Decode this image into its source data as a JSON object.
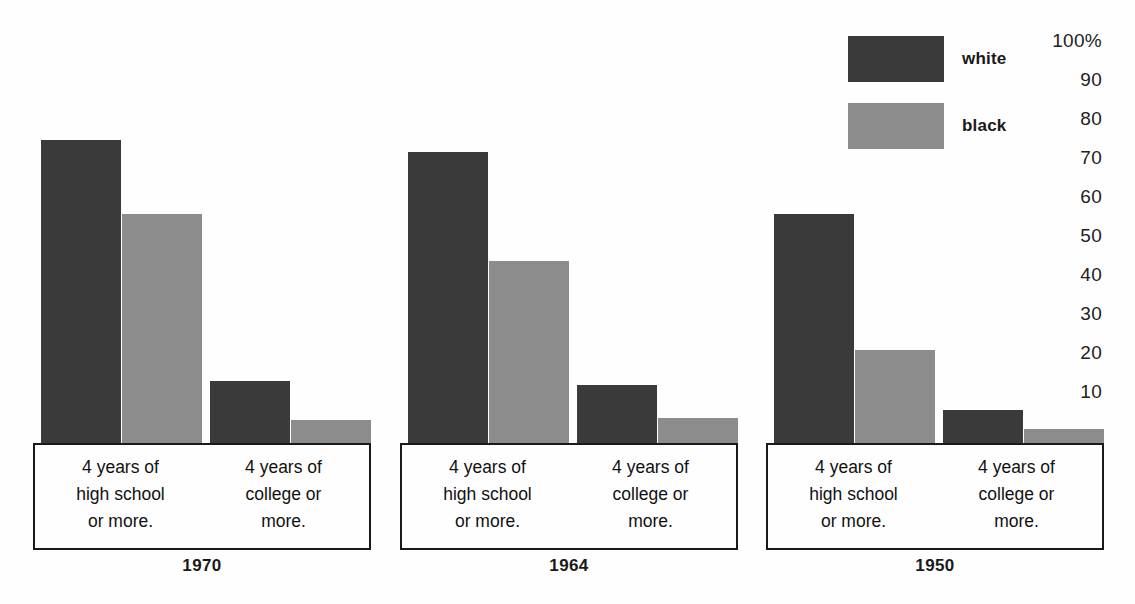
{
  "legend": {
    "items": [
      {
        "label": "white",
        "color": "#3a3a3a",
        "swatch_name": "legend-swatch-white"
      },
      {
        "label": "black",
        "color": "#8c8c8c",
        "swatch_name": "legend-swatch-black"
      }
    ]
  },
  "yaxis": {
    "ticks": [
      {
        "label": "100%",
        "value": 100
      },
      {
        "label": "90",
        "value": 90
      },
      {
        "label": "80",
        "value": 80
      },
      {
        "label": "70",
        "value": 70
      },
      {
        "label": "60",
        "value": 60
      },
      {
        "label": "50",
        "value": 50
      },
      {
        "label": "40",
        "value": 40
      },
      {
        "label": "30",
        "value": 30
      },
      {
        "label": "20",
        "value": 20
      },
      {
        "label": "10",
        "value": 10
      }
    ]
  },
  "categories": [
    {
      "id": "hs",
      "caption": "4 years of\nhigh school\nor more."
    },
    {
      "id": "col",
      "caption": "4 years of\ncollege or\nmore."
    }
  ],
  "groups": [
    {
      "year": "1970",
      "box_left": 33,
      "box_width": 338,
      "cells": [
        {
          "caption": "4 years of\nhigh school\nor more.",
          "bars": [
            {
              "series": "white",
              "value": 78
            },
            {
              "series": "black",
              "value": 59
            }
          ]
        },
        {
          "caption": "4 years of\ncollege or\nmore.",
          "bars": [
            {
              "series": "white",
              "value": 16
            },
            {
              "series": "black",
              "value": 6
            }
          ]
        }
      ]
    },
    {
      "year": "1964",
      "box_left": 400,
      "box_width": 338,
      "cells": [
        {
          "caption": "4 years of\nhigh school\nor more.",
          "bars": [
            {
              "series": "white",
              "value": 75
            },
            {
              "series": "black",
              "value": 47
            }
          ]
        },
        {
          "caption": "4 years of\ncollege or\nmore.",
          "bars": [
            {
              "series": "white",
              "value": 15
            },
            {
              "series": "black",
              "value": 6.5
            }
          ]
        }
      ]
    },
    {
      "year": "1950",
      "box_left": 766,
      "box_width": 338,
      "cells": [
        {
          "caption": "4 years of\nhigh school\nor more.",
          "bars": [
            {
              "series": "white",
              "value": 59
            },
            {
              "series": "black",
              "value": 24
            }
          ]
        },
        {
          "caption": "4 years of\ncollege or\nmore.",
          "bars": [
            {
              "series": "white",
              "value": 8.5
            },
            {
              "series": "black",
              "value": 3.5
            }
          ]
        }
      ]
    }
  ],
  "chart_data": {
    "type": "bar",
    "title": "",
    "xlabel": "",
    "ylabel": "",
    "ylim": [
      0,
      100
    ],
    "grid": false,
    "legend_position": "top-right",
    "y_tick_labels": [
      "100%",
      "90",
      "80",
      "70",
      "60",
      "50",
      "40",
      "30",
      "20",
      "10"
    ],
    "y_ticks": [
      100,
      90,
      80,
      70,
      60,
      50,
      40,
      30,
      20,
      10
    ],
    "groups": [
      "1970",
      "1964",
      "1950"
    ],
    "categories": [
      "4 years of high school or more.",
      "4 years of college or more."
    ],
    "series": [
      {
        "name": "white",
        "color": "#3a3a3a",
        "values": {
          "1970": {
            "4 years of high school or more.": 78,
            "4 years of college or more.": 16
          },
          "1964": {
            "4 years of high school or more.": 75,
            "4 years of college or more.": 15
          },
          "1950": {
            "4 years of high school or more.": 59,
            "4 years of college or more.": 8.5
          }
        }
      },
      {
        "name": "black",
        "color": "#8c8c8c",
        "values": {
          "1970": {
            "4 years of high school or more.": 59,
            "4 years of college or more.": 6
          },
          "1964": {
            "4 years of high school or more.": 47,
            "4 years of college or more.": 6.5
          },
          "1950": {
            "4 years of high school or more.": 24,
            "4 years of college or more.": 3.5
          }
        }
      }
    ],
    "units": "percent"
  },
  "layout": {
    "baseline_y": 443,
    "px_per_unit": 3.88,
    "box_top": 443,
    "box_bottom": 546,
    "year_label_y": 556,
    "bar_width": 80,
    "colors": {
      "white_series": "#3a3a3a",
      "black_series": "#8c8c8c",
      "outline": "#1a1a1a"
    }
  }
}
